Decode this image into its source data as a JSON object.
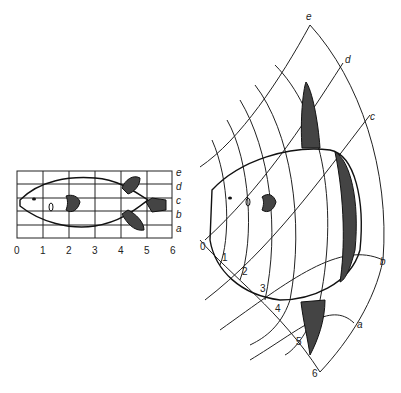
{
  "left_grid": {
    "x_labels": [
      "0",
      "1",
      "2",
      "3",
      "4",
      "5",
      "6"
    ],
    "y_labels": [
      "a",
      "b",
      "c",
      "d",
      "e"
    ]
  },
  "right_grid": {
    "radial_labels": [
      "0",
      "1",
      "2",
      "3",
      "4",
      "5",
      "6"
    ],
    "arc_labels": [
      "a",
      "b",
      "c",
      "d",
      "e"
    ]
  }
}
